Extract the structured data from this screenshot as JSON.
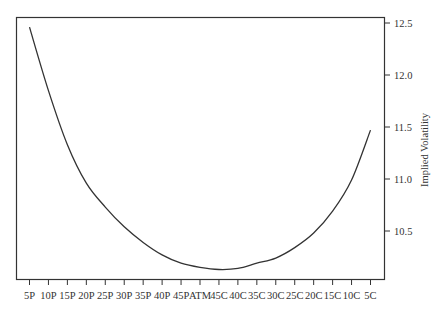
{
  "chart_data": {
    "type": "line",
    "title": "",
    "xlabel": "",
    "ylabel": "Implied Volatility",
    "categories": [
      "5P",
      "10P",
      "15P",
      "20P",
      "25P",
      "30P",
      "35P",
      "40P",
      "45P",
      "ATM",
      "45C",
      "40C",
      "35C",
      "30C",
      "25C",
      "20C",
      "15C",
      "10C",
      "5C"
    ],
    "series": [
      {
        "name": "Implied Volatility",
        "values": [
          12.46,
          11.85,
          11.33,
          10.96,
          10.73,
          10.54,
          10.39,
          10.27,
          10.19,
          10.15,
          10.13,
          10.14,
          10.19,
          10.24,
          10.34,
          10.48,
          10.69,
          10.99,
          11.47
        ]
      }
    ],
    "yticks": [
      10.5,
      11.0,
      11.5,
      12.0,
      12.5
    ],
    "ytick_labels": [
      "10.5",
      "11.0",
      "11.5",
      "12.0",
      "12.5"
    ],
    "ylim": [
      10.05,
      12.56
    ],
    "y_axis_position": "right",
    "grid": false,
    "legend": null,
    "colors": {
      "line": "#333333",
      "frame": "#333333",
      "background": "#ffffff"
    }
  }
}
